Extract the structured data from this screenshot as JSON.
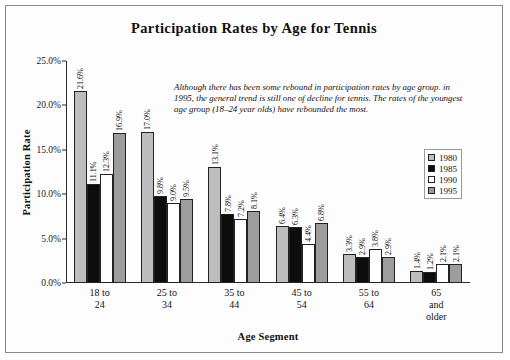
{
  "chart_data": {
    "type": "bar",
    "title": "Participation Rates by Age for Tennis",
    "xlabel": "Age Segment",
    "ylabel": "Participation Rate",
    "ylim": [
      0,
      25
    ],
    "ytick_labels": [
      "25.0%",
      "20.0%",
      "15.0%",
      "10.0%",
      "5.0%",
      "0.0%"
    ],
    "ytick_values": [
      25,
      20,
      15,
      10,
      5,
      0
    ],
    "grid": false,
    "legend_position": "right",
    "categories": [
      "18 to 24",
      "25 to 34",
      "35 to 44",
      "45 to 54",
      "55 to 64",
      "65 and older"
    ],
    "category_lines": [
      [
        "18 to",
        "24"
      ],
      [
        "25 to",
        "34"
      ],
      [
        "35 to",
        "44"
      ],
      [
        "45 to",
        "54"
      ],
      [
        "55 to",
        "64"
      ],
      [
        "65",
        "and",
        "older"
      ]
    ],
    "series": [
      {
        "name": "1980",
        "color": "#bdbdbd",
        "values": [
          21.6,
          17.0,
          13.1,
          6.4,
          3.3,
          1.4
        ],
        "labels": [
          "21.6%",
          "17.0%",
          "13.1%",
          "6.4%",
          "3.3%",
          "1.4%"
        ]
      },
      {
        "name": "1985",
        "color": "#0d0d0d",
        "values": [
          11.1,
          9.8,
          7.8,
          6.3,
          2.9,
          1.2
        ],
        "labels": [
          "11.1%",
          "9.8%",
          "7.8%",
          "6.3%",
          "2.9%",
          "1.2%"
        ]
      },
      {
        "name": "1990",
        "color": "#ffffff",
        "values": [
          12.3,
          9.0,
          7.2,
          4.4,
          3.8,
          2.1
        ],
        "labels": [
          "12.3%",
          "9.0%",
          "7.2%",
          "4.4%",
          "3.8%",
          "2.1%"
        ]
      },
      {
        "name": "1995",
        "color": "#9d9d9d",
        "values": [
          16.9,
          9.5,
          8.1,
          6.8,
          2.9,
          2.1
        ],
        "labels": [
          "16.9%",
          "9.5%",
          "8.1%",
          "6.8%",
          "2.9%",
          "2.1%"
        ]
      }
    ],
    "annotation": "Although there has been some rebound in participation rates by age group. in 1995, the general trend is still one of decline for tennis.  The  rates of the youngest age group (18–24 year olds) have rebounded the most."
  },
  "legend": {
    "items": [
      {
        "label": "1980",
        "color": "#bdbdbd"
      },
      {
        "label": "1985",
        "color": "#0d0d0d"
      },
      {
        "label": "1990",
        "color": "#ffffff"
      },
      {
        "label": "1995",
        "color": "#9d9d9d"
      }
    ]
  }
}
